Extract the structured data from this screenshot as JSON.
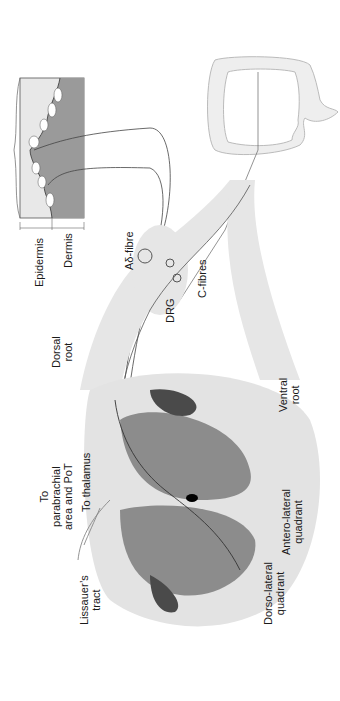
{
  "figure": {
    "orientation": "rotated -90deg",
    "colors": {
      "background": "#ffffff",
      "white_matter": "#e3e3e3",
      "grey_matter": "#8c8c8c",
      "dark_column": "#4a4a4a",
      "root_fill": "#e6e6e6",
      "skin_epidermis": "#e8e8e8",
      "skin_dermis": "#9a9a9a",
      "nerve_line": "#3a3a3a",
      "central_canal": "#000000"
    }
  },
  "labels": {
    "epidermis": "Epidermis",
    "dermis": "Dermis",
    "a_delta_fibre": "Aδ-fibre",
    "drg": "DRG",
    "c_fibres": "C-fibres",
    "dorsal_root_line1": "Dorsal",
    "dorsal_root_line2": "root",
    "ventral_root_line1": "Ventral",
    "ventral_root_line2": "root",
    "to_parabrachial_line1": "To",
    "to_parabrachial_line2": "parabrachial",
    "to_parabrachial_line3": "area and PoT",
    "to_thalamus": "To thalamus",
    "antero_lateral_line1": "Antero-lateral",
    "antero_lateral_line2": "quadrant",
    "dorso_lateral_line1": "Dorso-lateral",
    "dorso_lateral_line2": "quadrant",
    "lissauer_line1": "Lissauer’s",
    "lissauer_line2": "tract"
  }
}
